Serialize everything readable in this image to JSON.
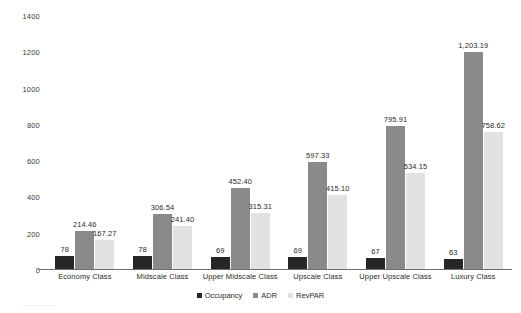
{
  "chart_data": {
    "type": "bar",
    "title": "",
    "subtitle": "",
    "xlabel": "",
    "ylabel": "",
    "ylim": [
      0,
      1400
    ],
    "yticks": [
      0,
      200,
      400,
      600,
      800,
      1000,
      1200,
      1400
    ],
    "ytick_labels": [
      "0",
      "200",
      "400",
      "600",
      "800",
      "1000",
      "1200",
      "1400"
    ],
    "grid": false,
    "legend_position": "bottom",
    "categories": [
      "Economy Class",
      "Midscale Class",
      "Upper Midscale Class",
      "Upscale Class",
      "Upper Upscale Class",
      "Luxury Class"
    ],
    "series": [
      {
        "name": "Occupancy",
        "color": "#262626",
        "values": [
          78,
          78,
          69,
          69,
          67,
          63
        ],
        "labels": [
          "78",
          "78",
          "69",
          "69",
          "67",
          "63"
        ]
      },
      {
        "name": "ADR",
        "color": "#8a8a8a",
        "values": [
          214.46,
          306.54,
          452.4,
          597.33,
          795.91,
          1203.19
        ],
        "labels": [
          "214.46",
          "306.54",
          "452.40",
          "597.33",
          "795.91",
          "1,203.19"
        ]
      },
      {
        "name": "RevPAR",
        "color": "#e2e2e2",
        "values": [
          167.27,
          241.4,
          315.31,
          415.1,
          534.15,
          758.62
        ],
        "labels": [
          "167.27",
          "241.40",
          "315.31",
          "415.10",
          "534.15",
          "758.62"
        ]
      }
    ]
  },
  "legend": {
    "items": [
      {
        "label": "Occupancy"
      },
      {
        "label": "ADR"
      },
      {
        "label": "RevPAR"
      }
    ]
  }
}
